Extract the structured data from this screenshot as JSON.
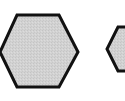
{
  "diagram": {
    "shapes": [
      {
        "type": "hexagon",
        "role": "large",
        "fill": "#d0d0d0",
        "stroke": "#111111",
        "points": "17,15 59,15 78,52 59,87 17,87 0,52"
      },
      {
        "type": "hexagon",
        "role": "small",
        "fill": "#d0d0d0",
        "stroke": "#111111",
        "points": "118,27 140,27 150,49 140,71 118,71 107,49"
      }
    ]
  }
}
